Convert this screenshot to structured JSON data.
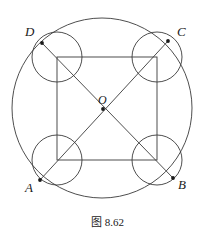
{
  "figure": {
    "caption": "图 8.62",
    "background_color": "#ffffff",
    "stroke_color": "#3a3a3a",
    "label_color": "#1a1a1a",
    "width": 215,
    "height": 239
  },
  "labels": {
    "A": "A",
    "B": "B",
    "C": "C",
    "D": "D",
    "O": "O"
  },
  "geometry": {
    "type": "euclidean-plane-figure",
    "description": "Square inscribed configuration: a large circle, an axis-aligned square whose corners carry four equal small circles, and the two diagonals meeting at centre O.",
    "big_circle": {
      "name": "circumscribed-circle",
      "cx": 102,
      "cy": 108,
      "r": 90
    },
    "square": {
      "name": "inner-square",
      "left": 57,
      "top": 57,
      "right": 157,
      "bottom": 160,
      "corners": [
        {
          "id": "square-corner-top-left",
          "x": 57,
          "y": 57
        },
        {
          "id": "square-corner-top-right",
          "x": 157,
          "y": 57
        },
        {
          "id": "square-corner-bottom-right",
          "x": 157,
          "y": 160
        },
        {
          "id": "square-corner-bottom-left",
          "x": 57,
          "y": 160
        }
      ]
    },
    "small_circles": [
      {
        "id": "small-circle-D",
        "cx": 57,
        "cy": 57,
        "r": 25
      },
      {
        "id": "small-circle-C",
        "cx": 157,
        "cy": 57,
        "r": 25
      },
      {
        "id": "small-circle-A",
        "cx": 57,
        "cy": 160,
        "r": 25
      },
      {
        "id": "small-circle-B",
        "cx": 157,
        "cy": 160,
        "r": 25
      }
    ],
    "points": [
      {
        "id": "point-A",
        "label": "A",
        "x": 40,
        "y": 180,
        "on": "big-circle"
      },
      {
        "id": "point-B",
        "label": "B",
        "x": 173,
        "y": 178,
        "on": "big-circle"
      },
      {
        "id": "point-C",
        "label": "C",
        "x": 168,
        "y": 41,
        "on": "big-circle"
      },
      {
        "id": "point-D",
        "label": "D",
        "x": 42,
        "y": 43,
        "on": "big-circle"
      },
      {
        "id": "point-O",
        "label": "O",
        "x": 103,
        "y": 109,
        "on": "diagonal-intersection"
      }
    ],
    "diagonals": [
      {
        "id": "diagonal-AC",
        "from": "point-A",
        "to": "point-C"
      },
      {
        "id": "diagonal-BD",
        "from": "point-D",
        "to": "point-B"
      }
    ]
  }
}
